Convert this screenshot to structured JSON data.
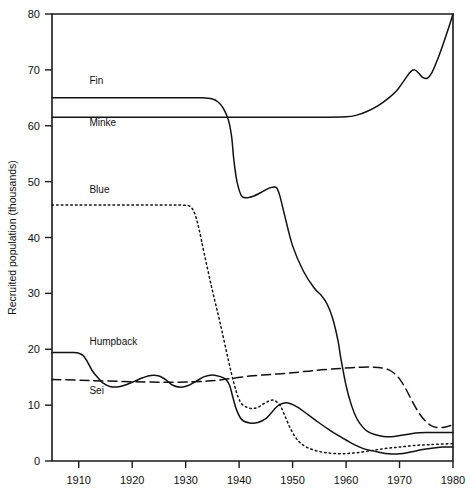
{
  "chart_data": {
    "type": "line",
    "title": "",
    "xlabel": "",
    "ylabel": "Recruited population (thousands)",
    "xlim": [
      1905,
      1980
    ],
    "ylim": [
      0,
      80
    ],
    "xticks": [
      1910,
      1920,
      1930,
      1940,
      1950,
      1960,
      1970,
      1980
    ],
    "xticklabels": [
      "1910",
      "1920",
      "1930",
      "1940",
      "1950",
      "1960",
      "1970",
      "1980"
    ],
    "yticks": [
      0,
      10,
      20,
      30,
      40,
      50,
      60,
      70,
      80
    ],
    "yticklabels": [
      "0",
      "10",
      "20",
      "30",
      "40",
      "50",
      "60",
      "70",
      "80"
    ],
    "grid": false,
    "legend": "inline-labels",
    "series": [
      {
        "name": "Fin",
        "label": "Fin",
        "style": "solid",
        "label_x": 1912,
        "label_y": 67.5,
        "x": [
          1905,
          1915,
          1925,
          1930,
          1933,
          1935,
          1936,
          1937,
          1938,
          1938.6,
          1939,
          1939.6,
          1940.5,
          1942,
          1944,
          1945.5,
          1946.3,
          1947,
          1947.6,
          1948.5,
          1950,
          1952,
          1954,
          1955.5,
          1956.5,
          1957.5,
          1958.5,
          1959,
          1960,
          1961,
          1962,
          1963,
          1964,
          1965.5,
          1967,
          1969,
          1971,
          1973,
          1975,
          1977,
          1980
        ],
        "y": [
          65,
          65,
          65,
          65,
          65,
          64.8,
          64.3,
          63.2,
          61.0,
          58.0,
          54.0,
          50.0,
          47.4,
          47.2,
          48.0,
          48.8,
          49.0,
          48.9,
          47.5,
          44.0,
          38.5,
          34.0,
          31.0,
          29.5,
          28.0,
          25.5,
          21.5,
          18.5,
          13.5,
          10.0,
          7.6,
          6.2,
          5.3,
          4.7,
          4.4,
          4.4,
          4.7,
          5.0,
          5.1,
          5.1,
          5.1
        ]
      },
      {
        "name": "Minke",
        "label": "Minke",
        "style": "solid",
        "label_x": 1912,
        "label_y": 60.0,
        "x": [
          1905,
          1920,
          1940,
          1955,
          1960,
          1962,
          1964,
          1966,
          1968,
          1969.5,
          1971,
          1972,
          1972.8,
          1973.6,
          1974.4,
          1975.2,
          1976,
          1977,
          1978,
          1979,
          1980
        ],
        "y": [
          61.5,
          61.5,
          61.5,
          61.5,
          61.6,
          61.9,
          62.6,
          63.6,
          65.0,
          66.3,
          68.3,
          69.6,
          70.0,
          69.4,
          68.6,
          68.5,
          69.4,
          71.6,
          74.2,
          77.0,
          80.0
        ]
      },
      {
        "name": "Blue",
        "label": "Blue",
        "style": "dotted",
        "label_x": 1912,
        "label_y": 48.0,
        "x": [
          1905,
          1915,
          1925,
          1929,
          1930.5,
          1931.2,
          1931.8,
          1932.5,
          1933.5,
          1935,
          1936.5,
          1938,
          1939,
          1939.8,
          1940.5,
          1941.5,
          1942.5,
          1943.5,
          1944.5,
          1945.5,
          1946.3,
          1947,
          1947.8,
          1948.6,
          1949.5,
          1950.5,
          1951.5,
          1953,
          1955,
          1957,
          1959,
          1961,
          1963,
          1965,
          1967,
          1969,
          1971,
          1973,
          1975,
          1977,
          1980
        ],
        "y": [
          45.8,
          45.8,
          45.8,
          45.8,
          45.7,
          45.2,
          44.0,
          41.5,
          37.0,
          30.5,
          24.5,
          18.0,
          14.0,
          11.5,
          10.2,
          9.6,
          9.4,
          9.6,
          10.2,
          10.7,
          10.9,
          10.6,
          9.7,
          8.0,
          6.0,
          4.3,
          3.2,
          2.3,
          1.7,
          1.4,
          1.3,
          1.4,
          1.6,
          1.9,
          2.2,
          2.4,
          2.6,
          2.8,
          2.9,
          3.0,
          3.1
        ]
      },
      {
        "name": "Humpback",
        "label": "Humpback",
        "style": "solid",
        "label_x": 1912,
        "label_y": 20.8,
        "x": [
          1905,
          1909,
          1910,
          1910.8,
          1911.6,
          1912.5,
          1913.5,
          1914.5,
          1916,
          1917.5,
          1919,
          1920.5,
          1922,
          1923.5,
          1925,
          1926.5,
          1927.5,
          1929,
          1930.5,
          1932,
          1933.5,
          1935,
          1936.5,
          1937.5,
          1938.2,
          1938.8,
          1939.5,
          1940.5,
          1942,
          1943.5,
          1945,
          1946,
          1946.8,
          1947.6,
          1948.5,
          1949.5,
          1951,
          1953,
          1955,
          1957,
          1959,
          1961,
          1963,
          1964.5,
          1966,
          1968,
          1970,
          1972,
          1974,
          1976,
          1978,
          1980
        ],
        "y": [
          19.4,
          19.4,
          19.3,
          18.9,
          17.8,
          16.2,
          15.0,
          14.0,
          13.3,
          13.3,
          13.7,
          14.3,
          14.9,
          15.3,
          15.2,
          14.4,
          13.6,
          13.2,
          13.5,
          14.3,
          15.1,
          15.4,
          15.1,
          14.6,
          13.6,
          11.5,
          9.2,
          7.4,
          6.8,
          6.9,
          7.6,
          8.6,
          9.5,
          10.1,
          10.4,
          10.3,
          9.6,
          8.2,
          6.8,
          5.5,
          4.3,
          3.2,
          2.3,
          1.9,
          1.6,
          1.3,
          1.3,
          1.6,
          2.0,
          2.3,
          2.5,
          2.5
        ]
      },
      {
        "name": "Sei",
        "label": "Sei",
        "style": "dashed",
        "label_x": 1912,
        "label_y": 12.0,
        "x": [
          1905,
          1912,
          1920,
          1928,
          1934,
          1938,
          1942,
          1946,
          1950,
          1954,
          1958,
          1961,
          1963,
          1965,
          1966.5,
          1968,
          1969,
          1970,
          1971,
          1972,
          1973,
          1974,
          1975,
          1976,
          1977,
          1978,
          1979,
          1980
        ],
        "y": [
          14.6,
          14.4,
          14.2,
          14.1,
          14.3,
          14.7,
          15.2,
          15.5,
          15.8,
          16.2,
          16.5,
          16.7,
          16.8,
          16.8,
          16.7,
          16.3,
          15.7,
          14.7,
          13.2,
          11.4,
          9.6,
          8.1,
          7.0,
          6.3,
          6.0,
          6.0,
          6.2,
          6.5
        ]
      }
    ]
  }
}
